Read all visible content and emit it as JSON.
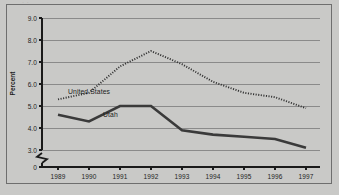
{
  "figure": {
    "clipped_top_text": "· ·",
    "background_color": "#c9c9c7",
    "plot_background_color": "#c9c9c7",
    "frame_color": "#6e6e6e",
    "gridline_color": "#8a8a8a",
    "axis_color": "#1a1a1a"
  },
  "chart_data": {
    "type": "line",
    "title": "",
    "subtitle": "",
    "xlabel": "",
    "ylabel": "Percent",
    "x": [
      "1989",
      "1990",
      "1991",
      "1992",
      "1993",
      "1994",
      "1995",
      "1996",
      "1997"
    ],
    "categories": [
      "1989",
      "1990",
      "1991",
      "1992",
      "1993",
      "1994",
      "1995",
      "1996",
      "1997"
    ],
    "ylim": [
      3.0,
      9.0
    ],
    "yticks": [
      "0",
      "3.0",
      "4.0",
      "5.0",
      "6.0",
      "7.0",
      "8.0",
      "9.0"
    ],
    "ytick_values": [
      0,
      3.0,
      4.0,
      5.0,
      6.0,
      7.0,
      8.0,
      9.0
    ],
    "y_axis_break": true,
    "y_axis_break_between": [
      0,
      3.0
    ],
    "grid": true,
    "grid_axis": "y",
    "legend": "inline-labels",
    "series": [
      {
        "name": "United States",
        "style": "dotted",
        "color": "#333333",
        "label_x": "1989",
        "values": [
          5.3,
          5.6,
          6.8,
          7.5,
          6.9,
          6.1,
          5.6,
          5.4,
          4.9
        ]
      },
      {
        "name": "Utah",
        "style": "solid",
        "color": "#3a3a3a",
        "label_x": "1990",
        "values": [
          4.6,
          4.3,
          5.0,
          5.0,
          3.9,
          3.7,
          3.6,
          3.5,
          3.1
        ]
      }
    ],
    "annotations": [
      {
        "text": "United States",
        "series": "United States"
      },
      {
        "text": "Utah",
        "series": "Utah"
      }
    ]
  }
}
